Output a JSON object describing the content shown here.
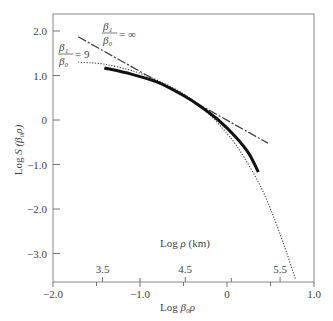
{
  "chart_data": {
    "type": "line",
    "title": "",
    "xlabel": "Log β0ρ",
    "ylabel": "Log S(β0ρ)",
    "secondary_xlabel": "Log ρ (km)",
    "xlim": [
      -2.0,
      1.0
    ],
    "ylim": [
      -3.5,
      2.35
    ],
    "grid": false,
    "x_ticks": [
      -2.0,
      -1.0,
      0,
      1.0
    ],
    "x_tick_labels": [
      "−2.0",
      "−1.0",
      "0",
      "1.0"
    ],
    "y_ticks": [
      2.0,
      1.0,
      0,
      -1.0,
      -2.0,
      -3.0
    ],
    "y_tick_labels": [
      "2.0",
      "1.0",
      "0",
      "−1.0",
      "−2.0",
      "−3.0"
    ],
    "secondary_x_ticks": [
      {
        "label": "3.5",
        "x": -1.43
      },
      {
        "label": "4.5",
        "x": -0.48
      },
      {
        "label": "5.5",
        "x": 0.61
      }
    ],
    "series": [
      {
        "name": "β1/β0 = ∞",
        "style": "dash-dot",
        "x": [
          -1.71,
          0.47
        ],
        "y": [
          1.87,
          -0.52
        ]
      },
      {
        "name": "β1/β0 = 9",
        "style": "dotted",
        "x": [
          -1.71,
          -1.4,
          -1.0,
          -0.6,
          -0.3,
          0.0,
          0.2,
          0.4,
          0.55,
          0.68,
          0.79
        ],
        "y": [
          1.3,
          1.25,
          1.05,
          0.7,
          0.3,
          -0.3,
          -0.85,
          -1.55,
          -2.25,
          -2.95,
          -3.6
        ]
      },
      {
        "name": "observed",
        "style": "solid-thick",
        "x": [
          -1.41,
          -1.1,
          -0.8,
          -0.5,
          -0.3,
          -0.1,
          0.1,
          0.25,
          0.36
        ],
        "y": [
          1.17,
          1.03,
          0.85,
          0.55,
          0.3,
          0.0,
          -0.38,
          -0.75,
          -1.17
        ]
      }
    ],
    "annotations": [
      {
        "text": "β1/β0 = ∞",
        "near_x": -1.3,
        "near_y": 2.0
      },
      {
        "text": "β1/β0 = 9",
        "near_x": -1.95,
        "near_y": 1.5
      }
    ]
  },
  "labels": {
    "xlabel_prefix": "Log ",
    "xlabel_var": "β₀ρ",
    "ylabel_prefix": "Log ",
    "ylabel_var": "S (β₀ρ)",
    "top_axis_prefix": "Log ",
    "top_axis_var": "ρ",
    "top_axis_unit": " (km)",
    "ann_inf_num": "β₁",
    "ann_inf_den": "β₀",
    "ann_inf_val": "= ∞",
    "ann_9_num": "β₁",
    "ann_9_den": "β₀",
    "ann_9_val": "= 9"
  }
}
